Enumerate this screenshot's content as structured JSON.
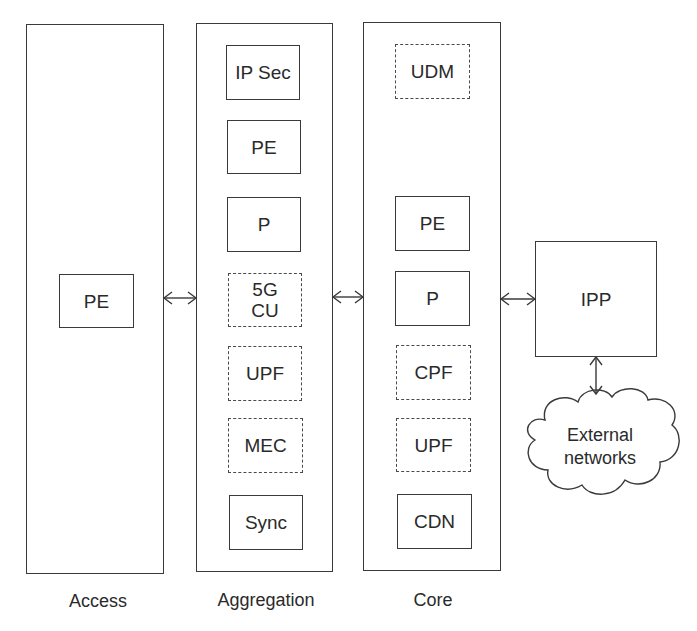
{
  "diagram": {
    "columns": [
      {
        "id": "access",
        "label": "Access",
        "nodes": [
          {
            "label": "PE",
            "style": "solid"
          }
        ]
      },
      {
        "id": "aggregation",
        "label": "Aggregation",
        "nodes": [
          {
            "label": "IP Sec",
            "style": "solid"
          },
          {
            "label": "PE",
            "style": "solid"
          },
          {
            "label": "P",
            "style": "solid"
          },
          {
            "label": "5G\nCU",
            "style": "dashed"
          },
          {
            "label": "UPF",
            "style": "dashed"
          },
          {
            "label": "MEC",
            "style": "dashed"
          },
          {
            "label": "Sync",
            "style": "solid"
          }
        ]
      },
      {
        "id": "core",
        "label": "Core",
        "nodes": [
          {
            "label": "UDM",
            "style": "dashed"
          },
          {
            "label": "PE",
            "style": "solid"
          },
          {
            "label": "P",
            "style": "solid"
          },
          {
            "label": "CPF",
            "style": "dashed"
          },
          {
            "label": "UPF",
            "style": "dashed"
          },
          {
            "label": "CDN",
            "style": "solid"
          }
        ]
      }
    ],
    "ipp": {
      "label": "IPP"
    },
    "external": {
      "label": "External\nnetworks"
    },
    "connections": [
      {
        "from": "access",
        "to": "aggregation",
        "type": "bidirectional"
      },
      {
        "from": "aggregation",
        "to": "core",
        "type": "bidirectional"
      },
      {
        "from": "core",
        "to": "ipp",
        "type": "bidirectional"
      },
      {
        "from": "ipp",
        "to": "external",
        "type": "bidirectional"
      }
    ]
  }
}
